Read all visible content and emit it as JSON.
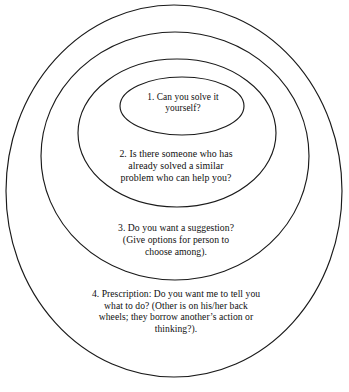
{
  "diagram": {
    "type": "concentric-ellipses",
    "title": "",
    "ring_count": 4,
    "stroke_color": "#1a1a1a",
    "background_color": "#ffffff",
    "text_color": "#101010",
    "zones": [
      {
        "level": 1,
        "name": "solve-it-yourself",
        "text": "1.  Can you solve it\nyourself?",
        "ellipse": {
          "cx": 182,
          "cy": 106,
          "rx": 62,
          "ry": 29
        }
      },
      {
        "level": 2,
        "name": "someone-who-has-solved-similar",
        "text": "2.  Is there someone who has\nalready solved a similar\nproblem who can help you?",
        "ellipse": {
          "cx": 177,
          "cy": 133,
          "rx": 99,
          "ry": 74
        }
      },
      {
        "level": 3,
        "name": "offer-a-suggestion",
        "text": "3.  Do you want a suggestion?\n(Give options for person to\nchoose among).",
        "ellipse": {
          "cx": 175,
          "cy": 156,
          "rx": 134,
          "ry": 124
        }
      },
      {
        "level": 4,
        "name": "prescription",
        "text": "4.  Prescription:  Do you want me to tell you\nwhat to do?  (Other is on his/her back\nwheels; they borrow another’s action or\nthinking?).",
        "ellipse": {
          "cx": 174,
          "cy": 191,
          "rx": 168,
          "ry": 186
        }
      }
    ]
  }
}
